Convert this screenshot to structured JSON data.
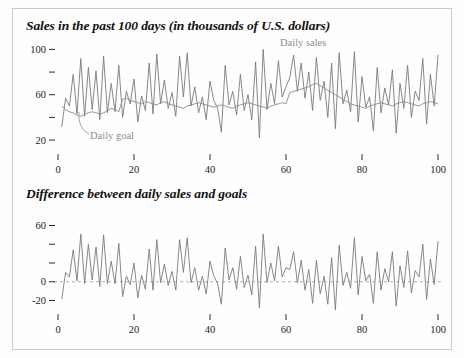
{
  "figure": {
    "background": "#fdfdfc",
    "border_color": "#c9c9c9",
    "line_color": "#7b7b7b",
    "text_color": "#1a1a1a",
    "annotation_color": "#8d8d8d"
  },
  "panels": {
    "top": {
      "title": "Sales in the past 100 days (in thousands of U.S. dollars)",
      "annotations": {
        "sales": "Daily sales",
        "goal": "Daily goal"
      }
    },
    "bottom": {
      "title": "Difference between daily sales and goals"
    }
  },
  "chart_data": [
    {
      "id": "sales-vs-goal",
      "type": "line",
      "title": "Sales in the past 100 days (in thousands of U.S. dollars)",
      "xlabel": "",
      "ylabel": "",
      "xlim": [
        0,
        100
      ],
      "ylim": [
        13,
        103
      ],
      "grid": false,
      "legend": "inline-annotations",
      "xticks": [
        0,
        20,
        40,
        60,
        80,
        100
      ],
      "xtick_labels": [
        "0",
        "20",
        "40",
        "60",
        "80",
        "100"
      ],
      "yticks": [
        20,
        40,
        60,
        80,
        100
      ],
      "ytick_labels": [
        "20",
        "",
        "60",
        "",
        "100"
      ],
      "x": [
        1,
        2,
        3,
        4,
        5,
        6,
        7,
        8,
        9,
        10,
        11,
        12,
        13,
        14,
        15,
        16,
        17,
        18,
        19,
        20,
        21,
        22,
        23,
        24,
        25,
        26,
        27,
        28,
        29,
        30,
        31,
        32,
        33,
        34,
        35,
        36,
        37,
        38,
        39,
        40,
        41,
        42,
        43,
        44,
        45,
        46,
        47,
        48,
        49,
        50,
        51,
        52,
        53,
        54,
        55,
        56,
        57,
        58,
        59,
        60,
        61,
        62,
        63,
        64,
        65,
        66,
        67,
        68,
        69,
        70,
        71,
        72,
        73,
        74,
        75,
        76,
        77,
        78,
        79,
        80,
        81,
        82,
        83,
        84,
        85,
        86,
        87,
        88,
        89,
        90,
        91,
        92,
        93,
        94,
        95,
        96,
        97,
        98,
        99,
        100
      ],
      "series": [
        {
          "name": "Daily sales",
          "color": "#7b7b7b",
          "values": [
            32,
            57,
            50,
            78,
            43,
            92,
            41,
            84,
            47,
            81,
            38,
            94,
            44,
            70,
            45,
            86,
            40,
            63,
            52,
            74,
            36,
            59,
            46,
            88,
            43,
            96,
            52,
            73,
            48,
            62,
            41,
            94,
            58,
            97,
            50,
            67,
            44,
            58,
            38,
            72,
            55,
            48,
            27,
            86,
            51,
            63,
            42,
            78,
            46,
            60,
            38,
            89,
            22,
            100,
            47,
            70,
            52,
            90,
            58,
            67,
            75,
            95,
            63,
            88,
            57,
            80,
            46,
            93,
            55,
            72,
            40,
            88,
            30,
            97,
            52,
            64,
            45,
            98,
            36,
            76,
            49,
            58,
            28,
            84,
            44,
            66,
            51,
            82,
            26,
            70,
            48,
            86,
            40,
            63,
            55,
            92,
            34,
            78,
            50,
            95
          ]
        },
        {
          "name": "Daily goal",
          "color": "#8a8a8a",
          "values": [
            50,
            47,
            45,
            44,
            42,
            41,
            43,
            44,
            45,
            44,
            43,
            44,
            46,
            48,
            47,
            45,
            56,
            57,
            55,
            54,
            53,
            52,
            54,
            53,
            52,
            51,
            53,
            54,
            52,
            51,
            50,
            49,
            48,
            50,
            51,
            52,
            53,
            52,
            51,
            50,
            49,
            50,
            51,
            50,
            49,
            48,
            50,
            51,
            52,
            53,
            52,
            51,
            50,
            49,
            48,
            50,
            51,
            52,
            53,
            52,
            62,
            63,
            64,
            65,
            66,
            67,
            69,
            70,
            68,
            66,
            64,
            62,
            60,
            58,
            56,
            54,
            52,
            51,
            50,
            49,
            48,
            50,
            51,
            52,
            53,
            52,
            51,
            50,
            52,
            53,
            54,
            53,
            52,
            51,
            50,
            52,
            53,
            54,
            53,
            52
          ]
        }
      ]
    },
    {
      "id": "difference",
      "type": "line",
      "title": "Difference between daily sales and goals",
      "xlabel": "",
      "ylabel": "",
      "xlim": [
        0,
        100
      ],
      "ylim": [
        -28,
        68
      ],
      "grid": false,
      "reference_line": 0,
      "reference_line_style": "dashed",
      "xticks": [
        0,
        20,
        40,
        60,
        80,
        100
      ],
      "xtick_labels": [
        "0",
        "20",
        "40",
        "60",
        "80",
        "100"
      ],
      "yticks": [
        -20,
        0,
        20,
        40,
        60
      ],
      "ytick_labels": [
        "-20",
        "0",
        "",
        "",
        "60"
      ],
      "x": [
        1,
        2,
        3,
        4,
        5,
        6,
        7,
        8,
        9,
        10,
        11,
        12,
        13,
        14,
        15,
        16,
        17,
        18,
        19,
        20,
        21,
        22,
        23,
        24,
        25,
        26,
        27,
        28,
        29,
        30,
        31,
        32,
        33,
        34,
        35,
        36,
        37,
        38,
        39,
        40,
        41,
        42,
        43,
        44,
        45,
        46,
        47,
        48,
        49,
        50,
        51,
        52,
        53,
        54,
        55,
        56,
        57,
        58,
        59,
        60,
        61,
        62,
        63,
        64,
        65,
        66,
        67,
        68,
        69,
        70,
        71,
        72,
        73,
        74,
        75,
        76,
        77,
        78,
        79,
        80,
        81,
        82,
        83,
        84,
        85,
        86,
        87,
        88,
        89,
        90,
        91,
        92,
        93,
        94,
        95,
        96,
        97,
        98,
        99,
        100
      ],
      "series": [
        {
          "name": "Sales minus goal",
          "color": "#7b7b7b",
          "values": [
            -18,
            10,
            5,
            34,
            1,
            51,
            -2,
            40,
            2,
            37,
            -5,
            50,
            -2,
            22,
            -2,
            41,
            -16,
            6,
            -3,
            20,
            -17,
            7,
            -8,
            35,
            -9,
            45,
            -1,
            19,
            -4,
            11,
            -9,
            45,
            10,
            47,
            -1,
            15,
            -9,
            6,
            -13,
            22,
            6,
            -2,
            -24,
            36,
            2,
            15,
            -8,
            27,
            -6,
            7,
            -14,
            38,
            -28,
            51,
            -1,
            20,
            1,
            38,
            5,
            15,
            13,
            32,
            -1,
            23,
            -9,
            13,
            -23,
            23,
            -13,
            6,
            -24,
            26,
            -30,
            39,
            -4,
            10,
            -7,
            47,
            -14,
            27,
            1,
            8,
            -23,
            32,
            -9,
            14,
            0,
            32,
            -26,
            17,
            -6,
            33,
            -12,
            12,
            5,
            40,
            -19,
            24,
            -3,
            43
          ]
        }
      ]
    }
  ]
}
